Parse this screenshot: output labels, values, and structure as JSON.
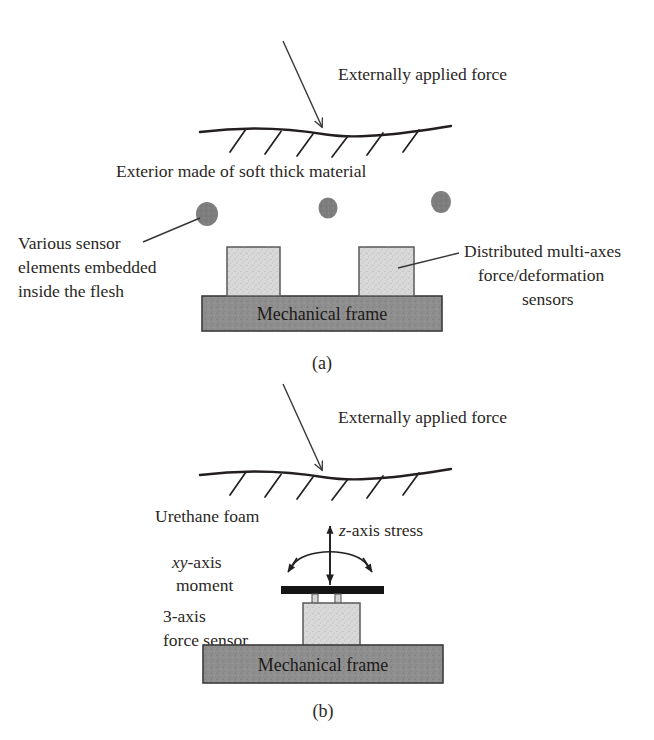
{
  "figure": {
    "panels": [
      {
        "id": "a",
        "caption": "(a)",
        "force_label": "Externally applied force",
        "exterior_label": "Exterior made of soft thick material",
        "left_label_lines": [
          "Various sensor",
          "elements embedded",
          "inside the flesh"
        ],
        "right_label_lines": [
          "Distributed multi-axes",
          "force/deformation",
          "sensors"
        ],
        "frame_label": "Mechanical frame",
        "hatch_count": 6,
        "sensor_dot_count": 3,
        "pillar_count": 2
      },
      {
        "id": "b",
        "caption": "(b)",
        "force_label": "Externally applied force",
        "foam_label": "Urethane foam",
        "z_stress_label_italic": "z",
        "z_stress_label_rest": "-axis stress",
        "moment_label_italic": "xy",
        "moment_label_rest": "-axis",
        "moment_label_line2": "moment",
        "sensor_label_lines": [
          "3-axis",
          "force sensor"
        ],
        "frame_label": "Mechanical frame",
        "hatch_count": 6
      }
    ],
    "colors": {
      "ink": "#231f20",
      "frame_fill": "#8d8d8d",
      "frame_stroke": "#3b3b3b",
      "block_fill": "#d6d6d6",
      "block_stroke": "#5a5a5a",
      "dot_fill": "#7e7e7e",
      "plate_fill": "#1a1a1a",
      "background": "#ffffff"
    }
  }
}
